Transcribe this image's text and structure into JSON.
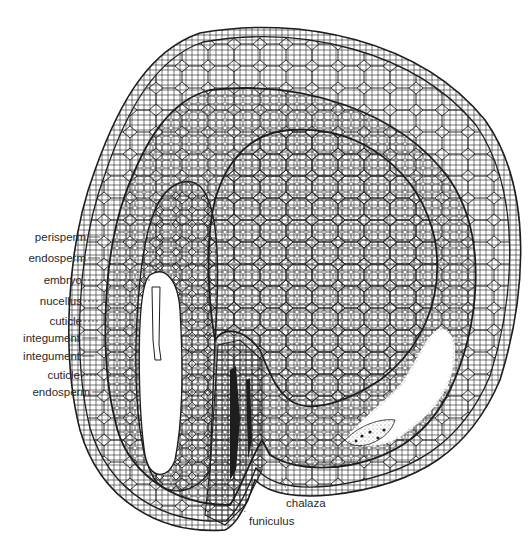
{
  "figure": {
    "colors": {
      "background": "#ffffff",
      "line": "#1e1e1e",
      "label": "#2a2a2a",
      "stipple": "#555555"
    },
    "labels_left": [
      {
        "id": "perisperm",
        "text": "perisperm",
        "y": 237,
        "leader": "solid"
      },
      {
        "id": "endosperm-upper",
        "text": "endosperm",
        "y": 258,
        "leader": "solid"
      },
      {
        "id": "embryo",
        "text": "embryo",
        "y": 280,
        "leader": "dashed"
      },
      {
        "id": "nucellus",
        "text": "nucellus",
        "y": 301,
        "leader": "dashed"
      },
      {
        "id": "cuticle-upper",
        "text": "cuticle",
        "y": 321,
        "leader": "dashed"
      },
      {
        "id": "integument-inner",
        "text": "integument",
        "y": 338,
        "leader": "solid"
      },
      {
        "id": "integument-outer",
        "text": "integument",
        "y": 356,
        "leader": "solid"
      },
      {
        "id": "cuticle-lower",
        "text": "cuticle",
        "y": 375,
        "leader": "dashed"
      },
      {
        "id": "endosperm-lower",
        "text": "endosperm",
        "y": 392,
        "leader": "solid"
      }
    ],
    "labels_bottom": [
      {
        "id": "chalaza",
        "text": "chalaza",
        "x": 286,
        "y": 503
      },
      {
        "id": "funiculus",
        "text": "funiculus",
        "x": 249,
        "y": 521
      }
    ]
  }
}
